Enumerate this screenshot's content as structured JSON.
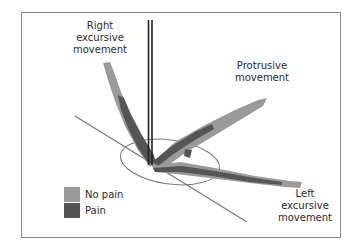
{
  "figure": {
    "labels": {
      "right_excursive": [
        "Right",
        "excursive",
        "movement"
      ],
      "protrusive": [
        "Protrusive",
        "movement"
      ],
      "left_excursive": [
        "Left",
        "excursive",
        "movement"
      ]
    },
    "legend": [
      {
        "label": "No pain",
        "color": "#9a9a9a"
      },
      {
        "label": "Pain",
        "color": "#555555"
      }
    ],
    "colors": {
      "no_pain": "#9a9a9a",
      "pain": "#555555",
      "frame": "#8a8a8a",
      "axis": "#222222",
      "reference_line": "#7a7a7a"
    }
  }
}
